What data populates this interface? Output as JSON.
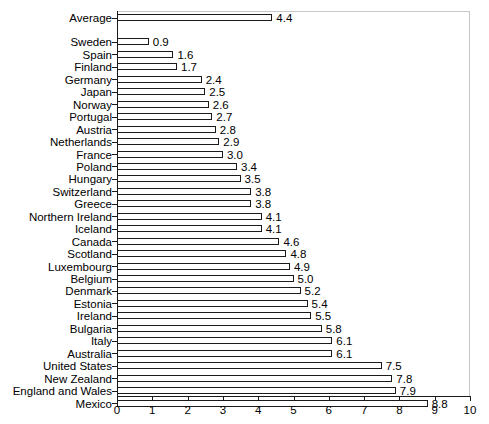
{
  "chart_data": {
    "type": "bar",
    "orientation": "horizontal",
    "title": "",
    "xlabel": "",
    "ylabel": "",
    "xlim": [
      0,
      10
    ],
    "xticks": [
      0,
      1,
      2,
      3,
      4,
      5,
      6,
      7,
      8,
      9,
      10
    ],
    "xtick_labels": [
      "0",
      "1",
      "2",
      "3",
      "4",
      "5",
      "6",
      "7",
      "8",
      "9",
      "10"
    ],
    "grid": false,
    "legend": null,
    "bar_style": {
      "fill": "#ffffff",
      "edge": "#1a1a1a"
    },
    "categories": [
      "Average",
      "Sweden",
      "Spain",
      "Finland",
      "Germany",
      "Japan",
      "Norway",
      "Portugal",
      "Austria",
      "Netherlands",
      "France",
      "Poland",
      "Hungary",
      "Switzerland",
      "Greece",
      "Northern Ireland",
      "Iceland",
      "Canada",
      "Scotland",
      "Luxembourg",
      "Belgium",
      "Denmark",
      "Estonia",
      "Ireland",
      "Bulgaria",
      "Italy",
      "Australia",
      "United States",
      "New Zealand",
      "England and Wales",
      "Mexico"
    ],
    "values": [
      4.4,
      0.9,
      1.6,
      1.7,
      2.4,
      2.5,
      2.6,
      2.7,
      2.8,
      2.9,
      3.0,
      3.4,
      3.5,
      3.8,
      3.8,
      4.1,
      4.1,
      4.6,
      4.8,
      4.9,
      5.0,
      5.2,
      5.4,
      5.5,
      5.8,
      6.1,
      6.1,
      7.5,
      7.8,
      7.9,
      8.8
    ],
    "value_labels": [
      "4.4",
      "0.9",
      "1.6",
      "1.7",
      "2.4",
      "2.5",
      "2.6",
      "2.7",
      "2.8",
      "2.9",
      "3.0",
      "3.4",
      "3.5",
      "3.8",
      "3.8",
      "4.1",
      "4.1",
      "4.6",
      "4.8",
      "4.9",
      "5.0",
      "5.2",
      "5.4",
      "5.5",
      "5.8",
      "6.1",
      "6.1",
      "7.5",
      "7.8",
      "7.9",
      "8.8"
    ]
  }
}
